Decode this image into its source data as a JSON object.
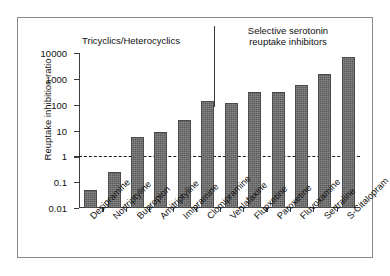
{
  "chart_data": {
    "type": "bar",
    "title": "",
    "xlabel": "",
    "ylabel": "Reuptake inhibition ratio",
    "yscale": "log",
    "ylim": [
      0.01,
      10000
    ],
    "ytick_labels": [
      "10000",
      "1000",
      "100",
      "10",
      "1",
      "0.1",
      "0.01"
    ],
    "ytick_values": [
      10000,
      1000,
      100,
      10,
      1,
      0.1,
      0.01
    ],
    "grid": false,
    "legend": "none",
    "reference_line": {
      "value": 1,
      "style": "dashed",
      "label": ""
    },
    "categories": [
      "Desipramine",
      "Nortriptyline",
      "Bupropion",
      "Amitriptyline",
      "Imipramine",
      "Clomipramine",
      "Venlafaxine",
      "Fluoxetine",
      "Paroxetine",
      "Fluvoxamine",
      "Sertraline",
      "S-Citalopram"
    ],
    "values": [
      0.05,
      0.25,
      5.5,
      8.5,
      26,
      135,
      115,
      300,
      320,
      600,
      1500,
      7000
    ],
    "groups": [
      {
        "label": "Tricyclics/Heterocyclics",
        "categories": [
          "Desipramine",
          "Nortriptyline",
          "Bupropion",
          "Amitriptyline",
          "Imipramine",
          "Clomipramine"
        ]
      },
      {
        "label": "Selective serotonin\nreuptake inhibitors",
        "categories": [
          "Venlafaxine",
          "Fluoxetine",
          "Paroxetine",
          "Fluvoxamine",
          "Sertraline",
          "S-Citalopram"
        ]
      }
    ],
    "bar_color": "#5a5a5a"
  },
  "annotations": {
    "group_tricyclics": "Tricyclics/Heterocyclics",
    "group_ssri": "Selective serotonin\nreuptake inhibitors"
  }
}
